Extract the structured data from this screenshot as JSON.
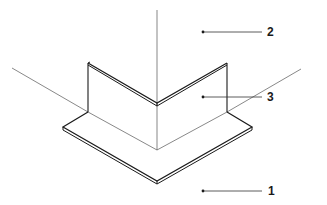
{
  "diagram": {
    "type": "isometric corner profile",
    "colors": {
      "line": "#1a1a1a",
      "thin_line": "#555555",
      "background": "#ffffff"
    },
    "callouts": [
      {
        "number": "2",
        "target": "vertical wall plane / upper space"
      },
      {
        "number": "3",
        "target": "angled L-shaped wall profile"
      },
      {
        "number": "1",
        "target": "base plate / floor"
      }
    ]
  }
}
